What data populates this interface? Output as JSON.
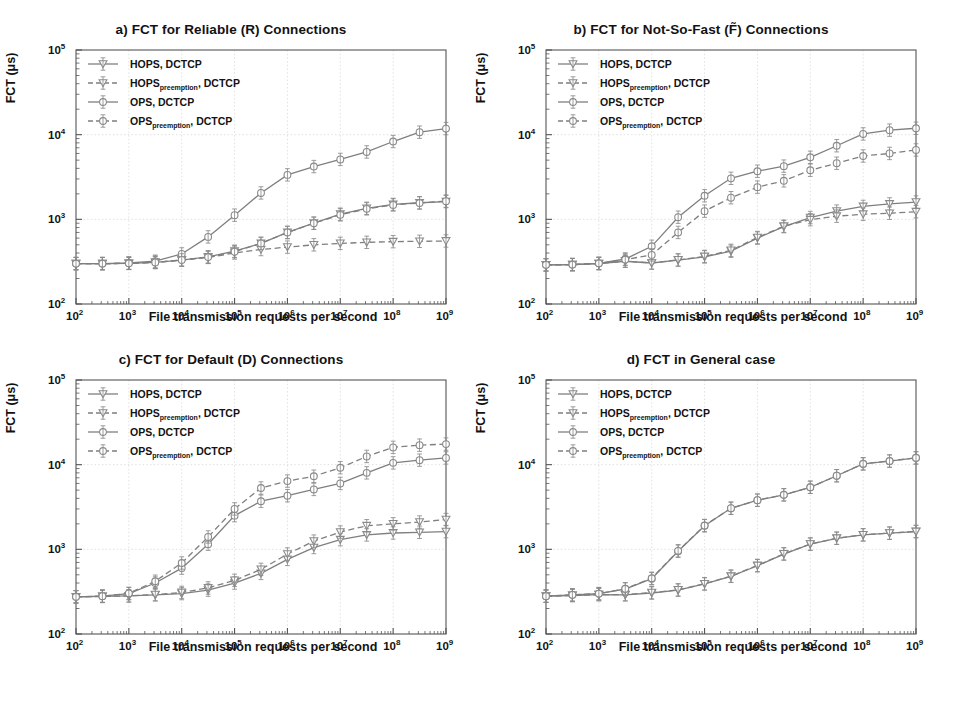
{
  "figure": {
    "axis_label_x": "File transmission requests per second",
    "axis_label_y": "FCT (μs)",
    "line_color": "#7f7f7f",
    "marker_color": "#8a8a8a",
    "grid_color": "#d9d9d9",
    "frame_color": "#555555"
  },
  "legend": {
    "entries": [
      {
        "label_main": "HOPS",
        "label_sub": "",
        "label_tail": ", DCTCP",
        "style": "solid",
        "marker": "triangle-down"
      },
      {
        "label_main": "HOPS",
        "label_sub": "preemption",
        "label_tail": ", DCTCP",
        "style": "dashed",
        "marker": "triangle-down"
      },
      {
        "label_main": "OPS",
        "label_sub": "",
        "label_tail": ", DCTCP",
        "style": "solid",
        "marker": "circle"
      },
      {
        "label_main": "OPS",
        "label_sub": "preemption",
        "label_tail": ", DCTCP",
        "style": "dashed",
        "marker": "circle"
      }
    ]
  },
  "chart_data": [
    {
      "id": "a",
      "type": "line",
      "title": "a) FCT for Reliable (R) Connections",
      "xlabel": "File transmission requests per second",
      "ylabel": "FCT (μs)",
      "xscale": "log",
      "yscale": "log",
      "xlim": [
        100,
        1000000000
      ],
      "ylim": [
        100,
        100000
      ],
      "xticks": [
        100,
        1000,
        10000,
        100000,
        1000000,
        10000000,
        100000000,
        1000000000
      ],
      "xticklabels": [
        "10^2",
        "10^3",
        "10^4",
        "10^5",
        "10^6",
        "10^7",
        "10^8",
        "10^9"
      ],
      "yticks": [
        100,
        1000,
        10000,
        100000
      ],
      "yticklabels": [
        "10^2",
        "10^3",
        "10^4",
        "10^5"
      ],
      "grid": true,
      "legend_position": "upper left",
      "x": [
        100,
        316,
        1000,
        3160,
        10000,
        31600,
        100000,
        316000,
        1000000,
        3160000,
        10000000,
        31600000,
        100000000,
        316000000,
        1000000000
      ],
      "series": [
        {
          "name": "HOPS, DCTCP",
          "style": "solid",
          "marker": "triangle-down",
          "values": [
            300,
            300,
            302,
            310,
            330,
            360,
            420,
            520,
            700,
            900,
            1150,
            1350,
            1500,
            1570,
            1620
          ]
        },
        {
          "name": "HOPS_preemption, DCTCP",
          "style": "dashed",
          "marker": "triangle-down",
          "values": [
            300,
            300,
            302,
            310,
            330,
            355,
            400,
            440,
            470,
            500,
            520,
            535,
            545,
            550,
            555
          ]
        },
        {
          "name": "OPS, DCTCP",
          "style": "solid",
          "marker": "circle",
          "values": [
            300,
            300,
            305,
            320,
            390,
            620,
            1120,
            2050,
            3350,
            4200,
            5100,
            6250,
            8300,
            10700,
            11800
          ]
        },
        {
          "name": "OPS_preemption, DCTCP",
          "style": "dashed",
          "marker": "circle",
          "values": [
            300,
            300,
            302,
            310,
            332,
            358,
            415,
            520,
            700,
            900,
            1130,
            1330,
            1480,
            1560,
            1640
          ]
        }
      ]
    },
    {
      "id": "b",
      "type": "line",
      "title": "b) FCT for Not-So-Fast (F̃) Connections",
      "xlabel": "File transmission requests per second",
      "ylabel": "FCT (μs)",
      "xscale": "log",
      "yscale": "log",
      "xlim": [
        100,
        1000000000
      ],
      "ylim": [
        100,
        100000
      ],
      "xticks": [
        100,
        1000,
        10000,
        100000,
        1000000,
        10000000,
        100000000,
        1000000000
      ],
      "xticklabels": [
        "10^2",
        "10^3",
        "10^4",
        "10^5",
        "10^6",
        "10^7",
        "10^8",
        "10^9"
      ],
      "yticks": [
        100,
        1000,
        10000,
        100000
      ],
      "yticklabels": [
        "10^2",
        "10^3",
        "10^4",
        "10^5"
      ],
      "grid": true,
      "legend_position": "upper left",
      "x": [
        100,
        316,
        1000,
        3160,
        10000,
        31600,
        100000,
        316000,
        1000000,
        3160000,
        10000000,
        31600000,
        100000000,
        316000000,
        1000000000
      ],
      "series": [
        {
          "name": "HOPS, DCTCP",
          "style": "solid",
          "marker": "triangle-down",
          "values": [
            290,
            292,
            300,
            320,
            305,
            330,
            360,
            420,
            600,
            820,
            1050,
            1250,
            1420,
            1520,
            1600
          ]
        },
        {
          "name": "HOPS_preemption, DCTCP",
          "style": "dashed",
          "marker": "triangle-down",
          "values": [
            290,
            292,
            300,
            320,
            305,
            332,
            365,
            430,
            610,
            830,
            990,
            1090,
            1150,
            1180,
            1230
          ]
        },
        {
          "name": "OPS, DCTCP",
          "style": "solid",
          "marker": "circle",
          "values": [
            290,
            292,
            302,
            340,
            480,
            1060,
            1900,
            3050,
            3700,
            4250,
            5400,
            7400,
            10200,
            11300,
            11900
          ]
        },
        {
          "name": "OPS_preemption, DCTCP",
          "style": "dashed",
          "marker": "circle",
          "values": [
            290,
            292,
            302,
            335,
            380,
            700,
            1250,
            1800,
            2400,
            2850,
            3800,
            4600,
            5600,
            6000,
            6600
          ]
        }
      ]
    },
    {
      "id": "c",
      "type": "line",
      "title": "c) FCT for Default (D) Connections",
      "xlabel": "File transmission requests per second",
      "ylabel": "FCT (μs)",
      "xscale": "log",
      "yscale": "log",
      "xlim": [
        100,
        1000000000
      ],
      "ylim": [
        100,
        100000
      ],
      "xticks": [
        100,
        1000,
        10000,
        100000,
        1000000,
        10000000,
        100000000,
        1000000000
      ],
      "xticklabels": [
        "10^2",
        "10^3",
        "10^4",
        "10^5",
        "10^6",
        "10^7",
        "10^8",
        "10^9"
      ],
      "yticks": [
        100,
        1000,
        10000,
        100000
      ],
      "yticklabels": [
        "10^2",
        "10^3",
        "10^4",
        "10^5"
      ],
      "grid": true,
      "legend_position": "upper left",
      "x": [
        100,
        316,
        1000,
        3160,
        10000,
        31600,
        100000,
        316000,
        1000000,
        3160000,
        10000000,
        31600000,
        100000000,
        316000000,
        1000000000
      ],
      "series": [
        {
          "name": "HOPS, DCTCP",
          "style": "solid",
          "marker": "triangle-down",
          "values": [
            275,
            278,
            282,
            290,
            300,
            330,
            400,
            520,
            760,
            1050,
            1300,
            1480,
            1560,
            1590,
            1620
          ]
        },
        {
          "name": "HOPS_preemption, DCTCP",
          "style": "dashed",
          "marker": "triangle-down",
          "values": [
            275,
            278,
            282,
            292,
            310,
            350,
            430,
            580,
            880,
            1250,
            1600,
            1900,
            2000,
            2100,
            2250
          ]
        },
        {
          "name": "OPS, DCTCP",
          "style": "solid",
          "marker": "circle",
          "values": [
            275,
            280,
            300,
            400,
            600,
            1150,
            2500,
            3700,
            4300,
            5100,
            6000,
            8000,
            10500,
            11300,
            12000
          ]
        },
        {
          "name": "OPS_preemption, DCTCP",
          "style": "dashed",
          "marker": "circle",
          "values": [
            275,
            280,
            302,
            420,
            690,
            1400,
            3000,
            5300,
            6400,
            7300,
            9200,
            12500,
            16000,
            17000,
            17500
          ]
        }
      ]
    },
    {
      "id": "d",
      "type": "line",
      "title": "d) FCT in General case",
      "xlabel": "File transmission requests per second",
      "ylabel": "FCT (μs)",
      "xscale": "log",
      "yscale": "log",
      "xlim": [
        100,
        1000000000
      ],
      "ylim": [
        100,
        100000
      ],
      "xticks": [
        100,
        1000,
        10000,
        100000,
        1000000,
        10000000,
        100000000,
        1000000000
      ],
      "xticklabels": [
        "10^2",
        "10^3",
        "10^4",
        "10^5",
        "10^6",
        "10^7",
        "10^8",
        "10^9"
      ],
      "yticks": [
        100,
        1000,
        10000,
        100000
      ],
      "yticklabels": [
        "10^2",
        "10^3",
        "10^4",
        "10^5"
      ],
      "grid": true,
      "legend_position": "upper left",
      "x": [
        100,
        316,
        1000,
        3160,
        10000,
        31600,
        100000,
        316000,
        1000000,
        3160000,
        10000000,
        31600000,
        100000000,
        316000000,
        1000000000
      ],
      "series": [
        {
          "name": "HOPS, DCTCP",
          "style": "solid",
          "marker": "triangle-down",
          "values": [
            280,
            285,
            292,
            290,
            305,
            330,
            390,
            480,
            640,
            880,
            1150,
            1350,
            1480,
            1550,
            1620
          ]
        },
        {
          "name": "HOPS_preemption, DCTCP",
          "style": "dashed",
          "marker": "triangle-down",
          "values": [
            280,
            285,
            292,
            292,
            308,
            332,
            392,
            482,
            645,
            885,
            1155,
            1355,
            1485,
            1555,
            1625
          ]
        },
        {
          "name": "OPS, DCTCP",
          "style": "solid",
          "marker": "circle",
          "values": [
            280,
            290,
            300,
            340,
            450,
            950,
            1900,
            3050,
            3800,
            4400,
            5400,
            7400,
            10200,
            11000,
            12000
          ]
        },
        {
          "name": "OPS_preemption, DCTCP",
          "style": "dashed",
          "marker": "circle",
          "values": [
            280,
            290,
            300,
            342,
            455,
            960,
            1910,
            3060,
            3810,
            4410,
            5410,
            7410,
            10250,
            11050,
            12050
          ]
        }
      ]
    }
  ]
}
